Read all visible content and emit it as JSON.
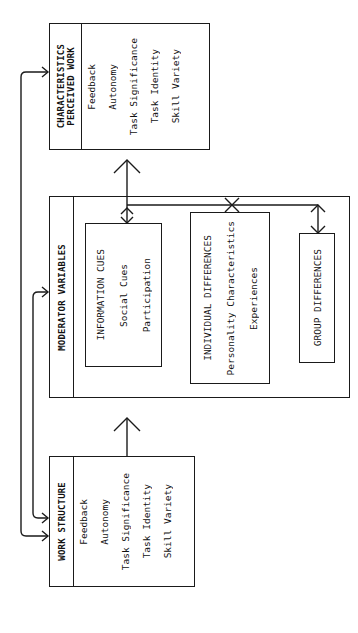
{
  "diagram": {
    "perceived_box": {
      "title_line1": "PERCEIVED WORK",
      "title_line2": "CHARACTERISTICS",
      "items": [
        "Skill Variety",
        "Task Identity",
        "Task Significance",
        "Autonomy",
        "Feedback"
      ]
    },
    "moderator_box": {
      "title": "MODERATOR VARIABLES",
      "information_cues": {
        "title": "INFORMATION CUES",
        "items": [
          "Social Cues",
          "Participation"
        ]
      },
      "individual_differences": {
        "title": "INDIVIDUAL DIFFERENCES",
        "items": [
          "Personality Characteristics",
          "Experiences"
        ]
      },
      "group_differences": {
        "title": "GROUP DIFFERENCES"
      }
    },
    "work_structure_box": {
      "title": "WORK STRUCTURE",
      "items": [
        "Skill Variety",
        "Task Identity",
        "Task Significance",
        "Autonomy",
        "Feedback"
      ]
    },
    "line_color": "#1a1a1a"
  }
}
